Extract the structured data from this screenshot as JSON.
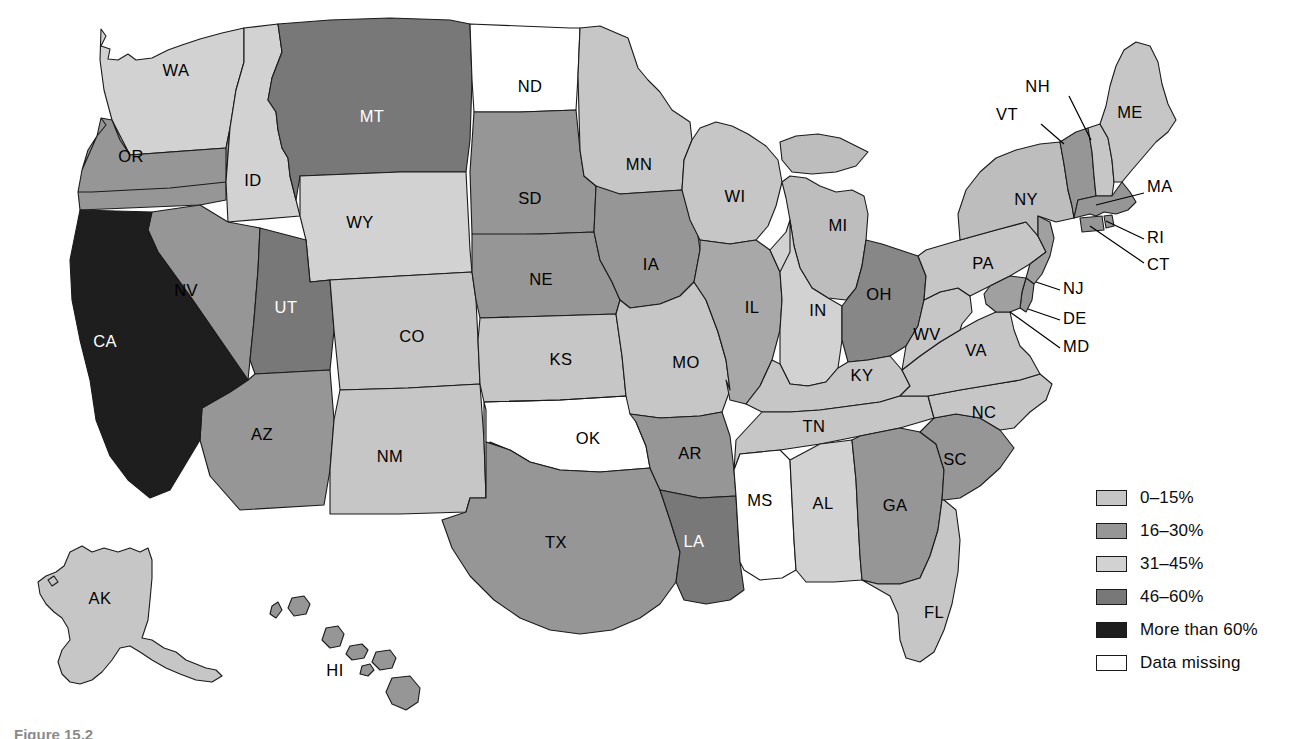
{
  "figure": {
    "caption": "Figure 15.2",
    "type": "choropleth-map",
    "region": "United States"
  },
  "legend": {
    "title": "",
    "items": [
      {
        "label": "0–15%",
        "color": "#c6c6c6",
        "key": "0-15"
      },
      {
        "label": "16–30%",
        "color": "#969696",
        "key": "16-30"
      },
      {
        "label": "31–45%",
        "color": "#d2d2d2",
        "key": "31-45"
      },
      {
        "label": "46–60%",
        "color": "#787878",
        "key": "46-60"
      },
      {
        "label": "More than 60%",
        "color": "#1e1e1e",
        "key": "gt60"
      },
      {
        "label": "Data missing",
        "color": "#ffffff",
        "key": "missing"
      }
    ]
  },
  "chart_data": {
    "type": "map",
    "title": "",
    "subtitle": "",
    "xlabel": "",
    "ylabel": "",
    "legend_position": "right",
    "value_classes": [
      "0–15%",
      "16–30%",
      "31–45%",
      "46–60%",
      "More than 60%",
      "Data missing"
    ],
    "states": [
      {
        "code": "WA",
        "class": "31-45",
        "color": "#d2d2d2",
        "label_color": "dark"
      },
      {
        "code": "OR",
        "class": "16-30",
        "color": "#969696",
        "label_color": "dark"
      },
      {
        "code": "CA",
        "class": "gt60",
        "color": "#1e1e1e",
        "label_color": "light"
      },
      {
        "code": "NV",
        "class": "16-30",
        "color": "#969696",
        "label_color": "dark"
      },
      {
        "code": "ID",
        "class": "31-45",
        "color": "#d2d2d2",
        "label_color": "dark"
      },
      {
        "code": "MT",
        "class": "46-60",
        "color": "#787878",
        "label_color": "light"
      },
      {
        "code": "WY",
        "class": "31-45",
        "color": "#d2d2d2",
        "label_color": "dark"
      },
      {
        "code": "UT",
        "class": "46-60",
        "color": "#787878",
        "label_color": "light"
      },
      {
        "code": "AZ",
        "class": "16-30",
        "color": "#969696",
        "label_color": "dark"
      },
      {
        "code": "CO",
        "class": "0-15",
        "color": "#c6c6c6",
        "label_color": "dark"
      },
      {
        "code": "NM",
        "class": "0-15",
        "color": "#c6c6c6",
        "label_color": "dark"
      },
      {
        "code": "ND",
        "class": "missing",
        "color": "#ffffff",
        "label_color": "dark"
      },
      {
        "code": "SD",
        "class": "16-30",
        "color": "#969696",
        "label_color": "dark"
      },
      {
        "code": "NE",
        "class": "16-30",
        "color": "#969696",
        "label_color": "dark"
      },
      {
        "code": "KS",
        "class": "0-15",
        "color": "#c6c6c6",
        "label_color": "dark"
      },
      {
        "code": "OK",
        "class": "0-15",
        "color": "#dcdcdc",
        "label_color": "dark"
      },
      {
        "code": "TX",
        "class": "16-30",
        "color": "#969696",
        "label_color": "dark"
      },
      {
        "code": "MN",
        "class": "31-45",
        "color": "#c6c6c6",
        "label_color": "dark"
      },
      {
        "code": "IA",
        "class": "16-30",
        "color": "#969696",
        "label_color": "dark"
      },
      {
        "code": "MO",
        "class": "0-15",
        "color": "#c6c6c6",
        "label_color": "dark"
      },
      {
        "code": "AR",
        "class": "16-30",
        "color": "#969696",
        "label_color": "dark"
      },
      {
        "code": "LA",
        "class": "46-60",
        "color": "#787878",
        "label_color": "light"
      },
      {
        "code": "WI",
        "class": "0-15",
        "color": "#c6c6c6",
        "label_color": "dark"
      },
      {
        "code": "IL",
        "class": "16-30",
        "color": "#a8a8a8",
        "label_color": "dark"
      },
      {
        "code": "MI",
        "class": "0-15",
        "color": "#bdbdbd",
        "label_color": "dark"
      },
      {
        "code": "IN",
        "class": "0-15",
        "color": "#d2d2d2",
        "label_color": "dark"
      },
      {
        "code": "OH",
        "class": "46-60",
        "color": "#878787",
        "label_color": "dark"
      },
      {
        "code": "KY",
        "class": "0-15",
        "color": "#c6c6c6",
        "label_color": "dark"
      },
      {
        "code": "TN",
        "class": "0-15",
        "color": "#c6c6c6",
        "label_color": "dark"
      },
      {
        "code": "MS",
        "class": "missing",
        "color": "#ffffff",
        "label_color": "dark"
      },
      {
        "code": "AL",
        "class": "0-15",
        "color": "#d2d2d2",
        "label_color": "dark"
      },
      {
        "code": "GA",
        "class": "16-30",
        "color": "#969696",
        "label_color": "dark"
      },
      {
        "code": "SC",
        "class": "16-30",
        "color": "#969696",
        "label_color": "dark"
      },
      {
        "code": "NC",
        "class": "0-15",
        "color": "#c6c6c6",
        "label_color": "dark"
      },
      {
        "code": "FL",
        "class": "0-15",
        "color": "#c6c6c6",
        "label_color": "dark"
      },
      {
        "code": "VA",
        "class": "0-15",
        "color": "#c6c6c6",
        "label_color": "dark"
      },
      {
        "code": "WV",
        "class": "0-15",
        "color": "#c6c6c6",
        "label_color": "dark"
      },
      {
        "code": "PA",
        "class": "0-15",
        "color": "#c6c6c6",
        "label_color": "dark"
      },
      {
        "code": "NY",
        "class": "0-15",
        "color": "#bdbdbd",
        "label_color": "dark"
      },
      {
        "code": "VT",
        "class": "16-30",
        "color": "#969696",
        "label_color": "dark"
      },
      {
        "code": "NH",
        "class": "0-15",
        "color": "#c6c6c6",
        "label_color": "dark"
      },
      {
        "code": "ME",
        "class": "0-15",
        "color": "#c6c6c6",
        "label_color": "dark"
      },
      {
        "code": "MA",
        "class": "16-30",
        "color": "#969696",
        "label_color": "dark"
      },
      {
        "code": "RI",
        "class": "16-30",
        "color": "#969696",
        "label_color": "dark"
      },
      {
        "code": "CT",
        "class": "16-30",
        "color": "#969696",
        "label_color": "dark"
      },
      {
        "code": "NJ",
        "class": "16-30",
        "color": "#a0a0a0",
        "label_color": "dark"
      },
      {
        "code": "DE",
        "class": "16-30",
        "color": "#969696",
        "label_color": "dark"
      },
      {
        "code": "MD",
        "class": "16-30",
        "color": "#a0a0a0",
        "label_color": "dark"
      },
      {
        "code": "AK",
        "class": "0-15",
        "color": "#c6c6c6",
        "label_color": "dark"
      },
      {
        "code": "HI",
        "class": "16-30",
        "color": "#969696",
        "label_color": "dark"
      }
    ]
  },
  "map_labels": {
    "inline": [
      {
        "code": "WA",
        "text": "WA",
        "x": 176,
        "y": 72
      },
      {
        "code": "OR",
        "text": "OR",
        "x": 131,
        "y": 158
      },
      {
        "code": "CA",
        "text": "CA",
        "x": 105,
        "y": 343
      },
      {
        "code": "NV",
        "text": "NV",
        "x": 186,
        "y": 292
      },
      {
        "code": "ID",
        "text": "ID",
        "x": 253,
        "y": 182
      },
      {
        "code": "MT",
        "text": "MT",
        "x": 372,
        "y": 118
      },
      {
        "code": "WY",
        "text": "WY",
        "x": 360,
        "y": 224
      },
      {
        "code": "UT",
        "text": "UT",
        "x": 286,
        "y": 309
      },
      {
        "code": "AZ",
        "text": "AZ",
        "x": 262,
        "y": 436
      },
      {
        "code": "CO",
        "text": "CO",
        "x": 412,
        "y": 338
      },
      {
        "code": "NM",
        "text": "NM",
        "x": 390,
        "y": 458
      },
      {
        "code": "ND",
        "text": "ND",
        "x": 530,
        "y": 88
      },
      {
        "code": "SD",
        "text": "SD",
        "x": 530,
        "y": 200
      },
      {
        "code": "NE",
        "text": "NE",
        "x": 541,
        "y": 281
      },
      {
        "code": "KS",
        "text": "KS",
        "x": 561,
        "y": 361
      },
      {
        "code": "OK",
        "text": "OK",
        "x": 588,
        "y": 440
      },
      {
        "code": "TX",
        "text": "TX",
        "x": 556,
        "y": 544
      },
      {
        "code": "MN",
        "text": "MN",
        "x": 639,
        "y": 166
      },
      {
        "code": "IA",
        "text": "IA",
        "x": 651,
        "y": 266
      },
      {
        "code": "MO",
        "text": "MO",
        "x": 686,
        "y": 364
      },
      {
        "code": "AR",
        "text": "AR",
        "x": 690,
        "y": 455
      },
      {
        "code": "LA",
        "text": "LA",
        "x": 694,
        "y": 543
      },
      {
        "code": "WI",
        "text": "WI",
        "x": 735,
        "y": 198
      },
      {
        "code": "IL",
        "text": "IL",
        "x": 752,
        "y": 309
      },
      {
        "code": "MI",
        "text": "MI",
        "x": 838,
        "y": 227
      },
      {
        "code": "IN",
        "text": "IN",
        "x": 818,
        "y": 312
      },
      {
        "code": "OH",
        "text": "OH",
        "x": 879,
        "y": 296
      },
      {
        "code": "KY",
        "text": "KY",
        "x": 862,
        "y": 377
      },
      {
        "code": "TN",
        "text": "TN",
        "x": 814,
        "y": 428
      },
      {
        "code": "MS",
        "text": "MS",
        "x": 760,
        "y": 502
      },
      {
        "code": "AL",
        "text": "AL",
        "x": 823,
        "y": 505
      },
      {
        "code": "GA",
        "text": "GA",
        "x": 895,
        "y": 507
      },
      {
        "code": "SC",
        "text": "SC",
        "x": 955,
        "y": 461
      },
      {
        "code": "NC",
        "text": "NC",
        "x": 984,
        "y": 414
      },
      {
        "code": "FL",
        "text": "FL",
        "x": 934,
        "y": 614
      },
      {
        "code": "VA",
        "text": "VA",
        "x": 976,
        "y": 352
      },
      {
        "code": "WV",
        "text": "WV",
        "x": 927,
        "y": 336
      },
      {
        "code": "PA",
        "text": "PA",
        "x": 983,
        "y": 265
      },
      {
        "code": "NY",
        "text": "NY",
        "x": 1026,
        "y": 201
      },
      {
        "code": "ME",
        "text": "ME",
        "x": 1130,
        "y": 114
      },
      {
        "code": "AK",
        "text": "AK",
        "x": 100,
        "y": 600
      },
      {
        "code": "HI",
        "text": "HI",
        "x": 335,
        "y": 672
      }
    ],
    "callouts": [
      {
        "code": "NH",
        "text": "NH",
        "tx": 1050,
        "ty": 88,
        "x1": 1069,
        "y1": 96,
        "x2": 1091,
        "y2": 140
      },
      {
        "code": "VT",
        "text": "VT",
        "tx": 1018,
        "ty": 116,
        "x1": 1041,
        "y1": 124,
        "x2": 1064,
        "y2": 144
      },
      {
        "code": "MA",
        "text": "MA",
        "tx": 1147,
        "ty": 188,
        "x1": 1144,
        "y1": 193,
        "x2": 1096,
        "y2": 205
      },
      {
        "code": "RI",
        "text": "RI",
        "tx": 1147,
        "ty": 239,
        "x1": 1144,
        "y1": 239,
        "x2": 1106,
        "y2": 221
      },
      {
        "code": "CT",
        "text": "CT",
        "tx": 1147,
        "ty": 266,
        "x1": 1144,
        "y1": 263,
        "x2": 1090,
        "y2": 226
      },
      {
        "code": "NJ",
        "text": "NJ",
        "tx": 1063,
        "ty": 290,
        "x1": 1060,
        "y1": 290,
        "x2": 1036,
        "y2": 282
      },
      {
        "code": "DE",
        "text": "DE",
        "tx": 1063,
        "ty": 320,
        "x1": 1060,
        "y1": 320,
        "x2": 1028,
        "y2": 309
      },
      {
        "code": "MD",
        "text": "MD",
        "tx": 1063,
        "ty": 348,
        "x1": 1060,
        "y1": 348,
        "x2": 1010,
        "y2": 312
      }
    ]
  }
}
